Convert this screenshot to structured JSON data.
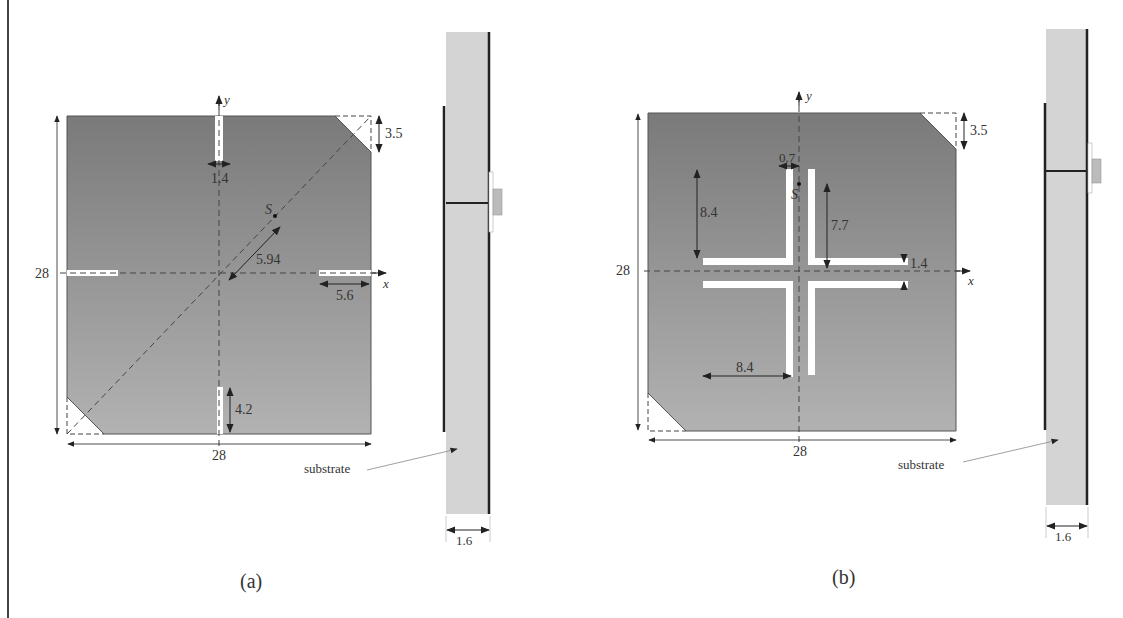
{
  "figure": {
    "colors": {
      "patch_top": "#7a7a7a",
      "patch_bottom": "#b0b0b0",
      "substrate": "#d4d4d4",
      "conductor": "#222222",
      "slot": "#ffffff",
      "dim_line": "#333333",
      "dash": "#444444",
      "frame": "#444444"
    },
    "panels": [
      {
        "id": "a",
        "caption": "(a)",
        "top_view": {
          "axis_x_label": "x",
          "axis_y_label": "y",
          "width_label": "28",
          "height_label": "28",
          "corner_cut_label": "3.5",
          "top_slot_width_label": "1.4",
          "bottom_slot_length_label": "4.2",
          "right_slot_length_label": "5.6",
          "feed_offset_label": "5.94",
          "feed_point_label": "S"
        },
        "side_view": {
          "substrate_label": "substrate",
          "thickness_label": "1.6"
        }
      },
      {
        "id": "b",
        "caption": "(b)",
        "top_view": {
          "axis_x_label": "x",
          "axis_y_label": "y",
          "width_label": "28",
          "height_label": "28",
          "corner_cut_label": "3.5",
          "slot_gap_label": "0.7",
          "vertical_arm_label": "8.4",
          "inner_arm_label": "7.7",
          "slot_spacing_label": "1.4",
          "horizontal_arm_label": "8.4",
          "feed_point_label": "S"
        },
        "side_view": {
          "substrate_label": "substrate",
          "thickness_label": "1.6"
        }
      }
    ]
  }
}
